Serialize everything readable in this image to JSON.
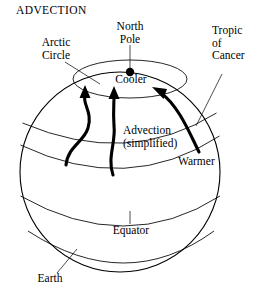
{
  "figure": {
    "title": "ADVECTION",
    "background_color": "#ffffff",
    "ink_color": "#000000"
  },
  "labels": {
    "title": "ADVECTION",
    "north_pole": "North\nPole",
    "arctic_circle": "Arctic\nCircle",
    "tropic_of_cancer": "Tropic\nof\nCancer",
    "cooler": "Cooler",
    "warmer": "Warmer",
    "advection": "Advection\n(simplified)",
    "equator": "Equator",
    "earth": "Earth"
  },
  "annotations": [
    {
      "name": "north-pole",
      "text": "North Pole",
      "points_to": "pole-dot"
    },
    {
      "name": "arctic-circle",
      "text": "Arctic Circle",
      "points_to": "arctic-circle-latitude"
    },
    {
      "name": "tropic-of-cancer",
      "text": "Tropic of Cancer",
      "points_to": "tropic-latitude"
    },
    {
      "name": "cooler",
      "text": "Cooler",
      "points_to": "polar-region"
    },
    {
      "name": "warmer",
      "text": "Warmer",
      "points_to": "low-latitude-region"
    },
    {
      "name": "advection",
      "text": "Advection (simplified)",
      "points_to": "flow-arrows"
    },
    {
      "name": "equator",
      "text": "Equator",
      "points_to": "equator-latitude"
    },
    {
      "name": "earth",
      "text": "Earth",
      "points_to": "sphere-outline"
    }
  ],
  "flow_arrows": [
    {
      "name": "flow-arrow-left",
      "direction": "northward",
      "shape": "s-curve"
    },
    {
      "name": "flow-arrow-center",
      "direction": "northward",
      "shape": "near-vertical"
    },
    {
      "name": "flow-arrow-right",
      "direction": "northwestward",
      "shape": "curved"
    }
  ]
}
